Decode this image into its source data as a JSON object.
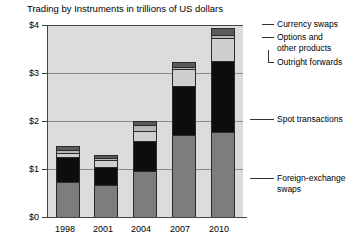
{
  "chart_data": {
    "type": "bar",
    "stacked": true,
    "title": "Trading by Instruments in trillions of US dollars",
    "xlabel": "",
    "ylabel": "",
    "categories": [
      "1998",
      "2001",
      "2004",
      "2007",
      "2010"
    ],
    "ytick_labels": [
      "$0",
      "$1",
      "$2",
      "$3",
      "$4"
    ],
    "ytick_values": [
      0,
      1,
      2,
      3,
      4
    ],
    "ylim": [
      0,
      4
    ],
    "grid": true,
    "legend_position": "right",
    "units": "trillions of US dollars",
    "series": [
      {
        "name": "Foreign-exchange swaps",
        "color": "#7d7d7d",
        "values": [
          0.73,
          0.66,
          0.95,
          1.71,
          1.77
        ]
      },
      {
        "name": "Spot transactions",
        "color": "#0d0d0d",
        "values": [
          0.52,
          0.39,
          0.63,
          1.01,
          1.49
        ]
      },
      {
        "name": "Outright forwards",
        "color": "#cfcfcf",
        "values": [
          0.09,
          0.13,
          0.21,
          0.36,
          0.48
        ]
      },
      {
        "name": "Options and other products",
        "color": "#b5b5b5",
        "values": [
          0.06,
          0.06,
          0.12,
          0.05,
          0.06
        ]
      },
      {
        "name": "Currency swaps",
        "color": "#5a5a5a",
        "values": [
          0.07,
          0.06,
          0.1,
          0.11,
          0.14
        ]
      }
    ],
    "totals": [
      1.47,
      1.3,
      2.01,
      3.24,
      3.94
    ]
  },
  "legend": {
    "items": [
      {
        "label": "Currency swaps"
      },
      {
        "label": "Options and"
      },
      {
        "label": "other products"
      },
      {
        "label": "Outright forwards"
      },
      {
        "label": "Spot transactions"
      },
      {
        "label": "Foreign-exchange"
      },
      {
        "label": "swaps"
      }
    ]
  }
}
